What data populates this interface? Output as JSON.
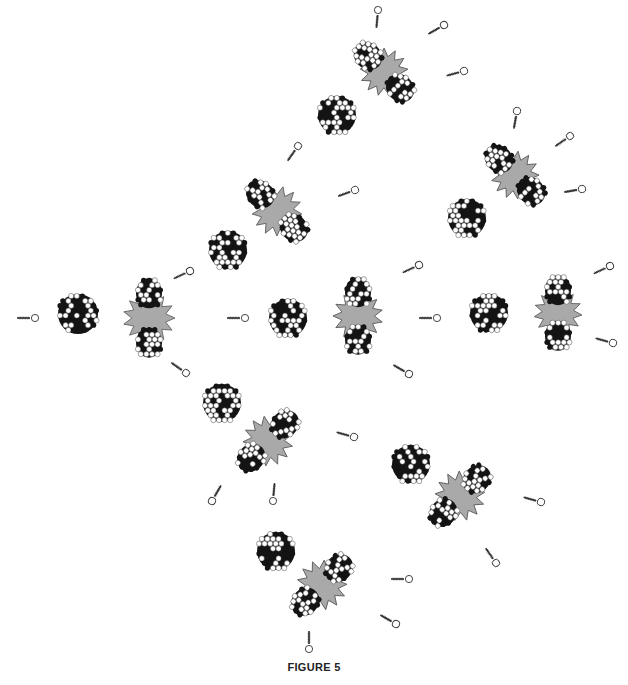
{
  "figure": {
    "caption": "FIGURE 5"
  },
  "colors": {
    "background": "#ffffff",
    "nucleon_dark": "#141414",
    "nucleon_light": "#ffffff",
    "burst_fill": "#a9a9a9",
    "burst_stroke": "#555555",
    "neutron_stroke": "#333333"
  },
  "icons": {
    "nucleus": "nucleus-icon",
    "fission_burst": "fission-burst-icon",
    "neutron": "neutron-icon"
  },
  "nuclei": [
    {
      "id": "n1",
      "x": 78,
      "y": 314,
      "r": 20
    },
    {
      "id": "n2",
      "x": 288,
      "y": 318,
      "r": 19
    },
    {
      "id": "n3",
      "x": 228,
      "y": 250,
      "r": 19
    },
    {
      "id": "n4",
      "x": 337,
      "y": 115,
      "r": 19
    },
    {
      "id": "n5",
      "x": 489,
      "y": 313,
      "r": 19
    },
    {
      "id": "n6",
      "x": 467,
      "y": 218,
      "r": 19
    },
    {
      "id": "n7",
      "x": 222,
      "y": 403,
      "r": 19
    },
    {
      "id": "n8",
      "x": 411,
      "y": 464,
      "r": 19
    },
    {
      "id": "n9",
      "x": 276,
      "y": 551,
      "r": 19
    }
  ],
  "fissions": [
    {
      "id": "f1",
      "x": 149,
      "y": 318,
      "angle": 90,
      "burst_r": 26
    },
    {
      "id": "f2",
      "x": 277,
      "y": 211,
      "angle": 45,
      "burst_r": 25
    },
    {
      "id": "f3",
      "x": 358,
      "y": 316,
      "angle": 90,
      "burst_r": 25
    },
    {
      "id": "f4",
      "x": 384,
      "y": 72,
      "angle": 45,
      "burst_r": 24
    },
    {
      "id": "f5",
      "x": 515,
      "y": 175,
      "angle": 45,
      "burst_r": 24
    },
    {
      "id": "f6",
      "x": 558,
      "y": 313,
      "angle": 90,
      "burst_r": 24
    },
    {
      "id": "f7",
      "x": 268,
      "y": 441,
      "angle": -45,
      "burst_r": 25
    },
    {
      "id": "f8",
      "x": 460,
      "y": 496,
      "angle": -45,
      "burst_r": 25
    },
    {
      "id": "f9",
      "x": 322,
      "y": 585,
      "angle": -45,
      "burst_r": 25
    }
  ],
  "neutrons": [
    {
      "x": 35,
      "y": 318,
      "angle": 180
    },
    {
      "x": 190,
      "y": 271,
      "angle": 155
    },
    {
      "x": 186,
      "y": 373,
      "angle": 215
    },
    {
      "x": 245,
      "y": 318,
      "angle": 180
    },
    {
      "x": 298,
      "y": 146,
      "angle": 125
    },
    {
      "x": 355,
      "y": 190,
      "angle": 160
    },
    {
      "x": 419,
      "y": 265,
      "angle": 155
    },
    {
      "x": 437,
      "y": 318,
      "angle": 180
    },
    {
      "x": 409,
      "y": 374,
      "angle": 210
    },
    {
      "x": 378,
      "y": 10,
      "angle": 95
    },
    {
      "x": 444,
      "y": 25,
      "angle": 150
    },
    {
      "x": 464,
      "y": 71,
      "angle": 165
    },
    {
      "x": 517,
      "y": 111,
      "angle": 100
    },
    {
      "x": 570,
      "y": 136,
      "angle": 145
    },
    {
      "x": 582,
      "y": 189,
      "angle": 170
    },
    {
      "x": 610,
      "y": 266,
      "angle": 155
    },
    {
      "x": 613,
      "y": 343,
      "angle": 195
    },
    {
      "x": 354,
      "y": 437,
      "angle": 195
    },
    {
      "x": 273,
      "y": 501,
      "angle": 275
    },
    {
      "x": 212,
      "y": 501,
      "angle": 300
    },
    {
      "x": 541,
      "y": 502,
      "angle": 195
    },
    {
      "x": 496,
      "y": 563,
      "angle": 235
    },
    {
      "x": 409,
      "y": 579,
      "angle": 180
    },
    {
      "x": 396,
      "y": 624,
      "angle": 210
    },
    {
      "x": 309,
      "y": 649,
      "angle": 270
    }
  ]
}
